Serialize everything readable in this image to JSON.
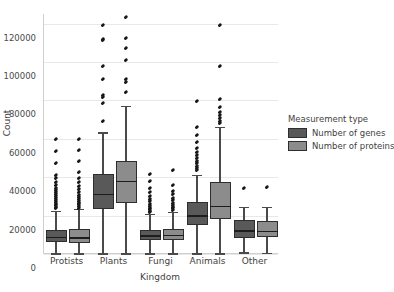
{
  "chart_data": {
    "type": "box",
    "title": "",
    "xlabel": "Kingdom",
    "ylabel": "Count",
    "categories": [
      "Protists",
      "Plants",
      "Fungi",
      "Animals",
      "Other"
    ],
    "ylim": [
      0,
      125000
    ],
    "yticks": [
      0,
      20000,
      40000,
      60000,
      80000,
      100000,
      120000
    ],
    "ytick_labels": [
      "0",
      "20000",
      "40000",
      "60000",
      "80000",
      "100000",
      "120000"
    ],
    "grid": true,
    "legend": {
      "title": "Measurement type",
      "position": "right",
      "entries": [
        {
          "label": "Number of genes",
          "color": "#595959"
        },
        {
          "label": "Number of proteins",
          "color": "#8c8c8c"
        }
      ]
    },
    "series": [
      {
        "name": "Number of genes",
        "color": "#595959",
        "boxes": [
          {
            "category": "Protists",
            "whisker_low": 300,
            "q1": 6200,
            "median": 9000,
            "q3": 12600,
            "whisker_high": 22600,
            "outliers": [
              23800,
              24600,
              25400,
              26200,
              27000,
              28000,
              29000,
              30000,
              31000,
              32200,
              33400,
              34600,
              36000,
              37600,
              39600,
              41400,
              47600,
              53900,
              60100
            ]
          },
          {
            "category": "Plants",
            "whisker_low": 300,
            "q1": 23600,
            "median": 31500,
            "q3": 41500,
            "whisker_high": 63300,
            "outliers": [
              69200,
              78400,
              81600,
              82900,
              91400,
              97900,
              111300,
              112000,
              119500
            ]
          },
          {
            "category": "Fungi",
            "whisker_low": 300,
            "q1": 7100,
            "median": 9800,
            "q3": 12500,
            "whisker_high": 20700,
            "outliers": [
              21800,
              22600,
              23400,
              24200,
              25200,
              26300,
              27500,
              28800,
              30300,
              32200,
              34500,
              37800,
              41600
            ]
          },
          {
            "category": "Animals",
            "whisker_low": 300,
            "q1": 15000,
            "median": 20200,
            "q3": 27000,
            "whisker_high": 41000,
            "outliers": [
              43500,
              44800,
              46000,
              47200,
              48400,
              49800,
              51400,
              53200,
              55400,
              58200,
              61900,
              66200,
              79800
            ]
          },
          {
            "category": "Other",
            "whisker_low": 800,
            "q1": 8400,
            "median": 12300,
            "q3": 17700,
            "whisker_high": 24700,
            "outliers": [
              34600
            ]
          }
        ]
      },
      {
        "name": "Number of proteins",
        "color": "#8c8c8c",
        "boxes": [
          {
            "category": "Protists",
            "whisker_low": 300,
            "q1": 5900,
            "median": 8600,
            "q3": 12900,
            "whisker_high": 23500,
            "outliers": [
              24200,
              25000,
              25800,
              26700,
              27600,
              28600,
              29700,
              30900,
              32200,
              33700,
              35400,
              37400,
              39800,
              42800,
              48200,
              54100,
              59700
            ]
          },
          {
            "category": "Plants",
            "whisker_low": 300,
            "q1": 26700,
            "median": 38000,
            "q3": 48200,
            "whisker_high": 77000,
            "outliers": [
              84200,
              89800,
              91000,
              101300,
              107500,
              112400,
              123500
            ]
          },
          {
            "category": "Fungi",
            "whisker_low": 300,
            "q1": 7300,
            "median": 10100,
            "q3": 13000,
            "whisker_high": 21800,
            "outliers": [
              22800,
              23700,
              24600,
              25600,
              26700,
              27900,
              29300,
              31000,
              33000,
              35800,
              43800
            ]
          },
          {
            "category": "Animals",
            "whisker_low": 300,
            "q1": 18000,
            "median": 25000,
            "q3": 37600,
            "whisker_high": 66400,
            "outliers": [
              68200,
              69500,
              70800,
              72300,
              74200,
              76400,
              80800,
              97900,
              119300
            ]
          },
          {
            "category": "Other",
            "whisker_low": 700,
            "q1": 8900,
            "median": 12200,
            "q3": 17400,
            "whisker_high": 24600,
            "outliers": [
              34700
            ]
          }
        ]
      }
    ]
  }
}
